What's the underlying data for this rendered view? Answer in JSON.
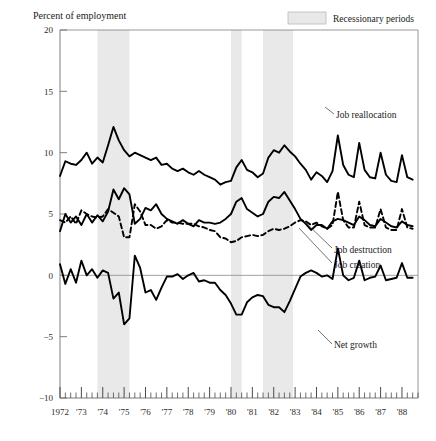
{
  "figure": {
    "y_axis_title": "Percent of employment",
    "legend": {
      "recession_label": "Recessionary periods",
      "swatch_color": "#e8e8e8",
      "swatch_border": "#b9b9b9"
    },
    "series_labels": {
      "reallocation": "Job reallocation",
      "destruction": "Job destruction",
      "creation": "Job creation",
      "net_growth": "Net growth"
    }
  },
  "chart_data": {
    "type": "line",
    "title": "",
    "xlabel": "",
    "ylabel": "Percent of employment",
    "ylim": [
      -10,
      20
    ],
    "xlim": [
      1972.0,
      1988.75
    ],
    "yticks": [
      -10,
      -5,
      0,
      5,
      10,
      15,
      20
    ],
    "ytick_labels": [
      "−10",
      "−5",
      "0",
      "5",
      "10",
      "15",
      "20"
    ],
    "xticks": [
      1972,
      1973,
      1974,
      1975,
      1976,
      1977,
      1978,
      1979,
      1980,
      1981,
      1982,
      1983,
      1984,
      1985,
      1986,
      1987,
      1988
    ],
    "xtick_labels": [
      "1972",
      "'73",
      "'74",
      "'75",
      "'76",
      "'77",
      "'78",
      "'79",
      "'80",
      "'81",
      "'82",
      "'83",
      "'84",
      "'85",
      "'86",
      "'87",
      "'88"
    ],
    "minor_tick_interval": 0.25,
    "grid": false,
    "legend_position": "top-right",
    "zero_line": true,
    "recession_bands": [
      {
        "start": 1973.75,
        "end": 1975.25
      },
      {
        "start": 1980.0,
        "end": 1980.5
      },
      {
        "start": 1981.5,
        "end": 1982.9
      }
    ],
    "x": [
      1972.0,
      1972.25,
      1972.5,
      1972.75,
      1973.0,
      1973.25,
      1973.5,
      1973.75,
      1974.0,
      1974.25,
      1974.5,
      1974.75,
      1975.0,
      1975.25,
      1975.5,
      1975.75,
      1976.0,
      1976.25,
      1976.5,
      1976.75,
      1977.0,
      1977.25,
      1977.5,
      1977.75,
      1978.0,
      1978.25,
      1978.5,
      1978.75,
      1979.0,
      1979.25,
      1979.5,
      1979.75,
      1980.0,
      1980.25,
      1980.5,
      1980.75,
      1981.0,
      1981.25,
      1981.5,
      1981.75,
      1982.0,
      1982.25,
      1982.5,
      1982.75,
      1983.0,
      1983.25,
      1983.5,
      1983.75,
      1984.0,
      1984.25,
      1984.5,
      1984.75,
      1985.0,
      1985.25,
      1985.5,
      1985.75,
      1986.0,
      1986.25,
      1986.5,
      1986.75,
      1987.0,
      1987.25,
      1987.5,
      1987.75,
      1988.0,
      1988.25,
      1988.5
    ],
    "series": [
      {
        "name": "Job reallocation",
        "style": "solid",
        "color": "#000000",
        "values": [
          8.1,
          9.3,
          9.1,
          9.0,
          9.4,
          10.0,
          9.1,
          9.6,
          9.2,
          10.6,
          12.1,
          11.0,
          10.2,
          9.7,
          10.0,
          9.8,
          9.6,
          9.4,
          9.6,
          9.0,
          9.1,
          8.7,
          8.5,
          8.7,
          8.4,
          8.2,
          8.5,
          8.2,
          8.0,
          7.8,
          7.4,
          7.6,
          7.7,
          8.8,
          9.4,
          8.6,
          8.4,
          8.0,
          8.3,
          9.6,
          10.2,
          10.0,
          10.6,
          10.1,
          9.7,
          9.1,
          8.6,
          7.8,
          8.4,
          8.1,
          7.6,
          8.5,
          11.4,
          9.0,
          8.2,
          8.0,
          10.8,
          8.6,
          8.0,
          7.9,
          10.0,
          8.2,
          7.7,
          7.6,
          9.8,
          8.0,
          7.8
        ]
      },
      {
        "name": "Job destruction",
        "style": "solid",
        "color": "#000000",
        "values": [
          3.6,
          5.0,
          4.3,
          4.8,
          4.1,
          5.0,
          4.3,
          4.9,
          4.4,
          5.2,
          7.0,
          6.2,
          7.1,
          6.6,
          4.2,
          4.6,
          5.5,
          5.3,
          5.8,
          5.0,
          4.6,
          4.4,
          4.2,
          4.5,
          4.2,
          4.0,
          4.5,
          4.3,
          4.3,
          4.2,
          4.3,
          4.6,
          5.0,
          6.0,
          6.3,
          5.4,
          5.1,
          4.8,
          5.0,
          6.0,
          6.4,
          6.3,
          6.8,
          6.1,
          5.4,
          4.6,
          4.2,
          3.7,
          4.1,
          4.1,
          3.8,
          4.4,
          4.6,
          4.5,
          4.3,
          4.1,
          4.8,
          4.5,
          4.1,
          4.0,
          4.6,
          4.3,
          4.0,
          3.9,
          4.4,
          4.1,
          4.0
        ]
      },
      {
        "name": "Job creation",
        "style": "dashed",
        "color": "#000000",
        "values": [
          4.5,
          4.3,
          4.8,
          4.2,
          5.3,
          5.0,
          4.8,
          4.7,
          4.8,
          5.4,
          5.1,
          4.8,
          3.1,
          3.1,
          5.8,
          5.2,
          4.1,
          4.1,
          3.8,
          4.0,
          4.5,
          4.3,
          4.3,
          4.2,
          4.2,
          4.2,
          4.0,
          3.9,
          3.7,
          3.6,
          3.1,
          3.0,
          2.7,
          2.8,
          3.1,
          3.2,
          3.3,
          3.2,
          3.3,
          3.6,
          3.8,
          3.7,
          3.8,
          4.0,
          4.3,
          4.5,
          4.4,
          4.1,
          4.3,
          4.0,
          3.8,
          4.1,
          6.8,
          4.5,
          3.9,
          3.9,
          6.0,
          4.1,
          3.9,
          3.9,
          5.4,
          3.9,
          3.7,
          3.7,
          5.4,
          3.9,
          3.8
        ]
      },
      {
        "name": "Net growth",
        "style": "solid",
        "color": "#000000",
        "values": [
          0.9,
          -0.7,
          0.5,
          -0.6,
          1.2,
          0.0,
          0.5,
          -0.2,
          0.4,
          0.2,
          -1.9,
          -1.4,
          -4.0,
          -3.5,
          1.6,
          0.6,
          -1.4,
          -1.2,
          -2.0,
          -1.0,
          -0.1,
          -0.1,
          0.1,
          -0.3,
          0.0,
          0.2,
          -0.5,
          -0.4,
          -0.6,
          -0.6,
          -1.2,
          -1.6,
          -2.3,
          -3.2,
          -3.2,
          -2.2,
          -1.8,
          -1.6,
          -1.7,
          -2.4,
          -2.6,
          -2.6,
          -3.0,
          -2.1,
          -1.1,
          -0.1,
          0.2,
          0.4,
          0.2,
          -0.1,
          0.0,
          -0.3,
          2.2,
          0.0,
          -0.4,
          -0.2,
          1.2,
          -0.4,
          -0.2,
          -0.1,
          0.8,
          -0.4,
          -0.3,
          -0.2,
          1.0,
          -0.2,
          -0.2
        ]
      }
    ]
  }
}
